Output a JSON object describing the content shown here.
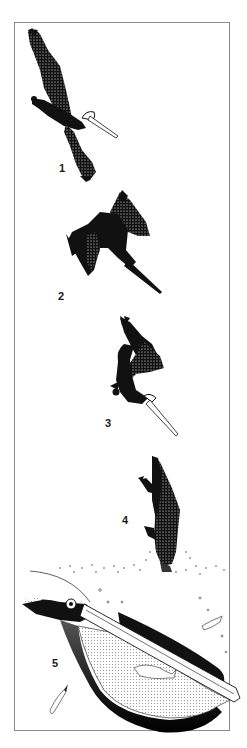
{
  "figure": {
    "border_color": "#8a8a8a",
    "ink_color": "#111111",
    "stages": [
      {
        "label": "1",
        "state": "soaring-spotting-prey"
      },
      {
        "label": "2",
        "state": "beginning-dive"
      },
      {
        "label": "3",
        "state": "wings-folding-steep-dive"
      },
      {
        "label": "4",
        "state": "entering-water"
      },
      {
        "label": "5",
        "state": "underwater-pouch-scooping-fish"
      }
    ]
  }
}
